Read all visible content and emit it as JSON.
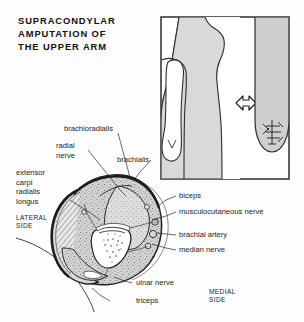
{
  "title": {
    "lines": [
      "SUPRACONDYLAR",
      "AMPUTATION  OF",
      "THE  UPPER  ARM"
    ],
    "full": "SUPRACONDYLAR AMPUTATION OF THE UPPER ARM"
  },
  "inset": {
    "name": "body-outline-inset",
    "description": "Body outline with arm and amputation stump",
    "arrow": "right-arrow",
    "border_color": "#3a3a3a",
    "fill_color": "#d9d9d9"
  },
  "cross_section": {
    "name": "arm-cross-section",
    "bone_label": "humerus",
    "fill_color": "#cfcfcf",
    "outline_color": "#2b2b2b"
  },
  "labels": {
    "left": [
      {
        "id": "brachioradialis",
        "text": "brachioradialis"
      },
      {
        "id": "radial-nerve",
        "text": "radial\nnerve",
        "line1": "radial",
        "line2": "nerve"
      },
      {
        "id": "brachialis",
        "text": "brachialis"
      },
      {
        "id": "extensor-carpi-radialis-longus",
        "line1": "extensor",
        "line2": "carpi",
        "line3": "radialis",
        "line4": "longus"
      }
    ],
    "right": [
      {
        "id": "biceps",
        "text": "biceps"
      },
      {
        "id": "musculocutaneous-nerve",
        "text": "musculocutaneous nerve"
      },
      {
        "id": "brachial-artery",
        "text": "brachial artery"
      },
      {
        "id": "median-nerve",
        "text": "median nerve"
      },
      {
        "id": "ulnar-nerve",
        "text": "ulnar nerve"
      },
      {
        "id": "triceps",
        "text": "triceps"
      }
    ],
    "orientation": [
      {
        "id": "lateral-side",
        "line1": "LATERAL",
        "line2": "SIDE"
      },
      {
        "id": "medial-side",
        "line1": "MEDIAL",
        "line2": "SIDE"
      }
    ]
  }
}
